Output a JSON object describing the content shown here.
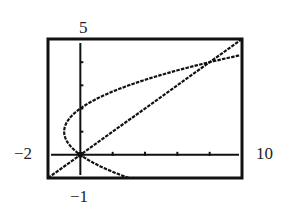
{
  "chart_data": {
    "type": "line",
    "title": "",
    "xlabel": "",
    "ylabel": "",
    "window": {
      "xmin": -2,
      "xmax": 10,
      "ymin": -1,
      "ymax": 5,
      "xscl": 2,
      "yscl": 1
    },
    "xlim": [
      -2,
      10
    ],
    "ylim": [
      -1,
      5
    ],
    "grid": false,
    "legend": null,
    "series": [
      {
        "name": "parabola x = y^2 - 2y",
        "type": "parametric",
        "points": [
          [
            3,
            -1
          ],
          [
            1.25,
            -0.5
          ],
          [
            0,
            0
          ],
          [
            -0.75,
            0.5
          ],
          [
            -1,
            1
          ],
          [
            -0.75,
            1.5
          ],
          [
            0,
            2
          ],
          [
            1.25,
            2.5
          ],
          [
            3,
            3
          ],
          [
            5.25,
            3.5
          ],
          [
            8,
            4
          ],
          [
            9.69,
            4.3
          ]
        ]
      },
      {
        "name": "line y = x/2",
        "type": "line",
        "points": [
          [
            -2,
            -1
          ],
          [
            0,
            0
          ],
          [
            8,
            4
          ],
          [
            10,
            5
          ]
        ]
      }
    ],
    "intersections": [
      [
        0,
        0
      ],
      [
        8,
        4
      ]
    ],
    "tick_labels": {
      "xmin": "-2",
      "xmax": "10",
      "ymin": "-1",
      "ymax": "5"
    }
  },
  "labels": {
    "ymax": "5",
    "ymin": "−1",
    "xmin": "−2",
    "xmax": "10"
  }
}
